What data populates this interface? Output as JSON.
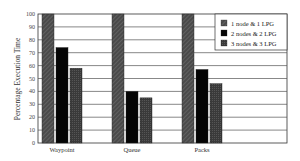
{
  "chart_data": {
    "type": "bar",
    "title": "",
    "xlabel": "",
    "ylabel": "Percentage Execution Time",
    "ylim": [
      0,
      100
    ],
    "yticks": [
      0,
      10,
      20,
      30,
      40,
      50,
      60,
      70,
      80,
      90,
      100
    ],
    "grid": true,
    "legend_position": "upper right",
    "categories": [
      "Waypoint",
      "Queue",
      "Packs"
    ],
    "series": [
      {
        "name": "1 node & 1 LPG",
        "values": [
          100,
          100,
          100
        ],
        "color": "#4a4a4a",
        "pattern": "diagonal-hatch"
      },
      {
        "name": "2 nodes & 2 LPG",
        "values": [
          74,
          40,
          57
        ],
        "color": "#050505",
        "pattern": "solid"
      },
      {
        "name": "3 nodes & 3 LPG",
        "values": [
          58,
          35,
          46
        ],
        "color": "#3a3a3a",
        "pattern": "crosshatch"
      }
    ]
  }
}
